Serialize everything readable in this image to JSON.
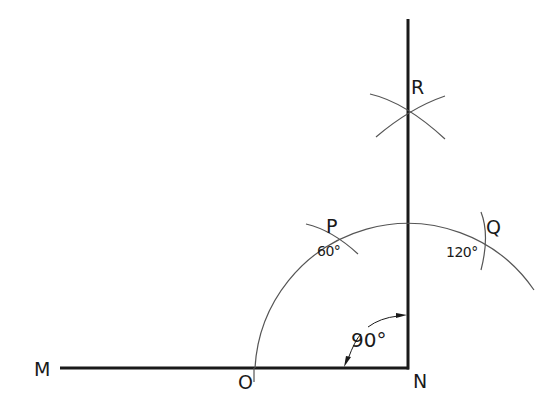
{
  "diagram": {
    "title": "",
    "colors": {
      "line": "#1a1a1a",
      "arc": "#555555",
      "background": "#ffffff"
    },
    "points": {
      "M": "M",
      "O": "O",
      "N": "N",
      "P": "P",
      "Q": "Q",
      "R": "R"
    },
    "angles": {
      "p": "60°",
      "q": "120°",
      "right": "90°"
    }
  }
}
